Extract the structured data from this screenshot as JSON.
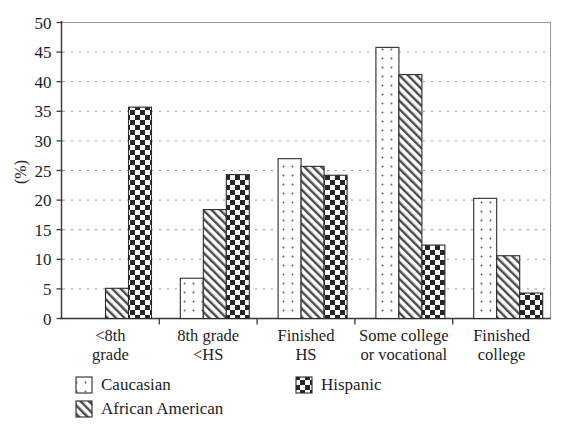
{
  "chart_data": {
    "type": "bar",
    "title": "",
    "xlabel": "",
    "ylabel": "(%)",
    "ylim": [
      0,
      50
    ],
    "yticks": [
      0,
      5,
      10,
      15,
      20,
      25,
      30,
      35,
      40,
      45,
      50
    ],
    "ytick_labels": [
      "0",
      "5",
      "10",
      "15",
      "20",
      "25",
      "30",
      "35",
      "40",
      "45",
      "50"
    ],
    "grid": "horizontal-dotted",
    "legend_position": "below-axis",
    "categories": [
      "<8th grade",
      "8th grade <HS",
      "Finished HS",
      "Some college or vocational",
      "Finished college"
    ],
    "category_lines": [
      [
        "<8th",
        "grade"
      ],
      [
        "8th grade",
        "<HS"
      ],
      [
        "Finished",
        "HS"
      ],
      [
        "Some college",
        "or vocational"
      ],
      [
        "Finished",
        "college"
      ]
    ],
    "series": [
      {
        "name": "Caucasian",
        "pattern": "dots",
        "values": [
          null,
          6.8,
          27.0,
          45.8,
          20.3
        ]
      },
      {
        "name": "African American",
        "pattern": "diagonal-hatch",
        "values": [
          5.1,
          18.4,
          25.7,
          41.2,
          10.6
        ]
      },
      {
        "name": "Hispanic",
        "pattern": "checkerboard",
        "values": [
          35.7,
          24.3,
          24.2,
          12.4,
          4.3
        ]
      }
    ]
  },
  "legend": {
    "entries": [
      {
        "label": "Caucasian",
        "pattern": "dots"
      },
      {
        "label": "African American",
        "pattern": "diagonal-hatch"
      },
      {
        "label": "Hispanic",
        "pattern": "checkerboard"
      }
    ]
  },
  "colors": {
    "background": "#ffffff",
    "ink": "#1d1d1d",
    "axis": "#3a3a3a",
    "frame": "#9a9a9a",
    "grid": "#8d8d8d",
    "pattern_dark": "#2b2b2b",
    "pattern_light": "#ffffff"
  }
}
